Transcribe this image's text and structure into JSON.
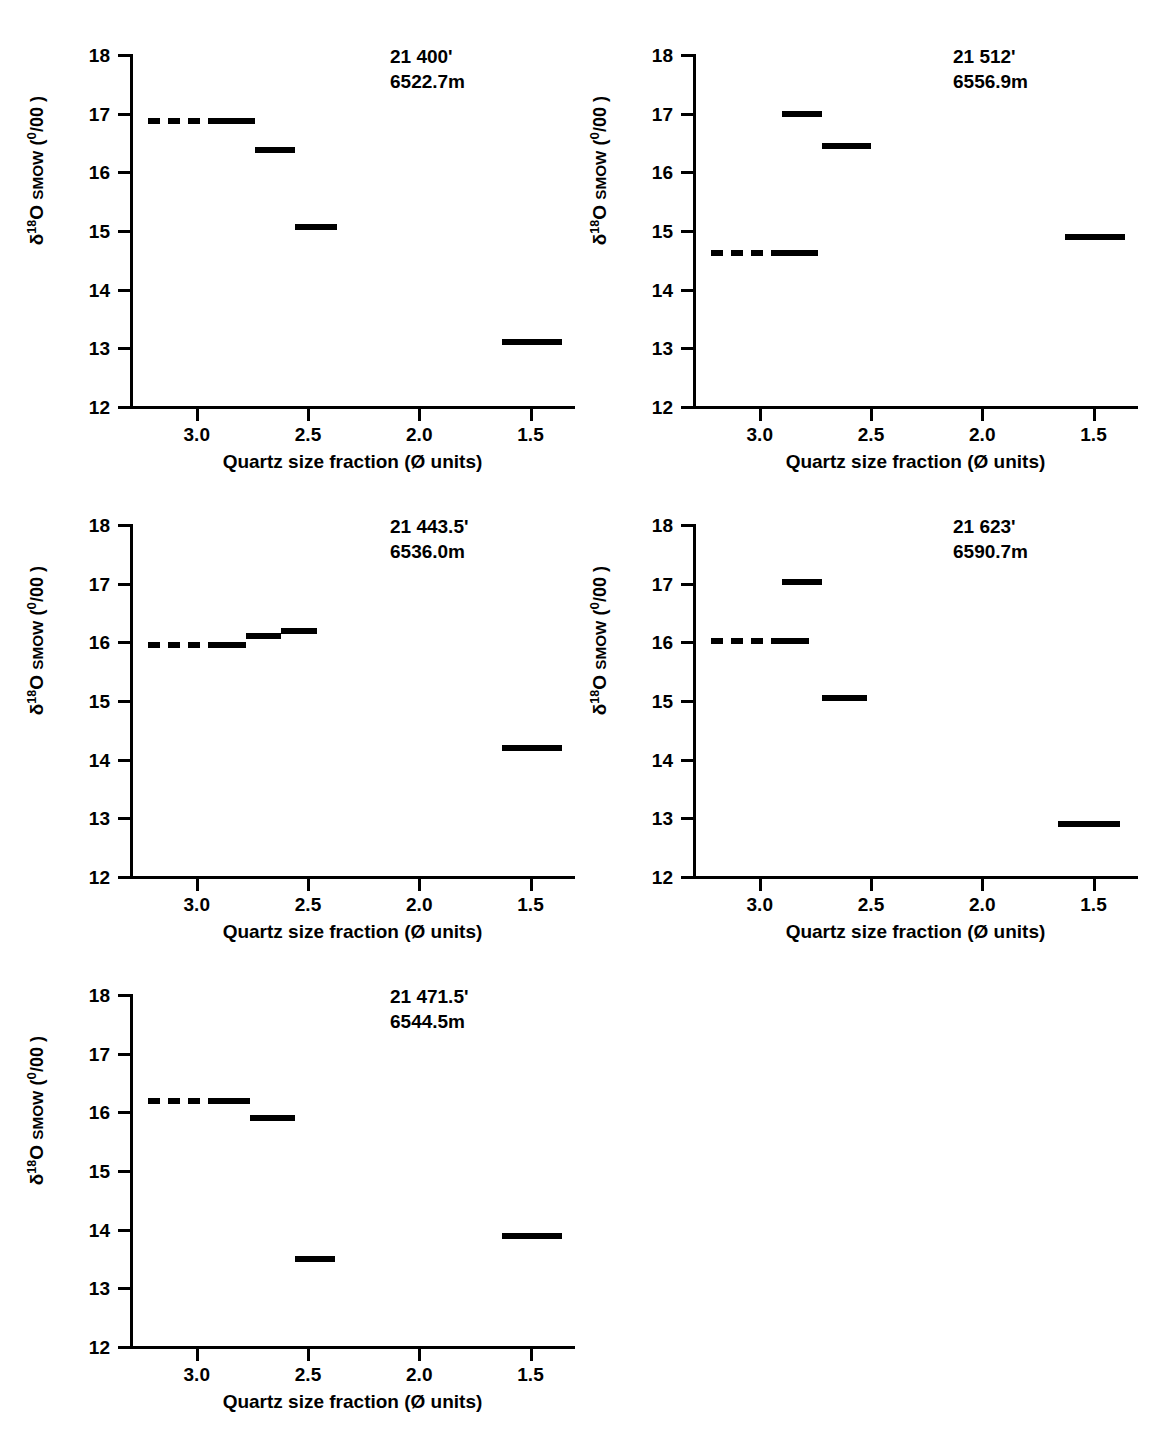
{
  "figure": {
    "axis": {
      "y_label_delta": "δ",
      "y_label_sup": "18",
      "y_label_o": "O",
      "y_label_smow": "SMOW",
      "y_label_units_open": "(",
      "y_label_permil_num": "0",
      "y_label_permil_slash": "/",
      "y_label_permil_den": "00",
      "y_label_units_close": ")",
      "y_ticks": [
        "18",
        "17",
        "16",
        "15",
        "14",
        "13",
        "12"
      ],
      "x_ticks": [
        "3.0",
        "2.5",
        "2.0",
        "1.5"
      ],
      "x_title": "Quartz size fraction (Ø units)"
    },
    "panels": [
      {
        "id": "panel-21400",
        "depth_feet": "21 400'",
        "depth_meters": "6522.7m",
        "bars": [
          {
            "x_start": 3.22,
            "x_end": 2.92,
            "value": 16.88,
            "dashed": true
          },
          {
            "x_start": 2.92,
            "x_end": 2.74,
            "value": 16.88,
            "dashed": false
          },
          {
            "x_start": 2.74,
            "x_end": 2.56,
            "value": 16.38,
            "dashed": false
          },
          {
            "x_start": 2.56,
            "x_end": 2.37,
            "value": 15.07,
            "dashed": false
          },
          {
            "x_start": 1.63,
            "x_end": 1.36,
            "value": 13.1,
            "dashed": false
          }
        ]
      },
      {
        "id": "panel-21512",
        "depth_feet": "21 512'",
        "depth_meters": "6556.9m",
        "bars": [
          {
            "x_start": 3.22,
            "x_end": 2.92,
            "value": 14.63,
            "dashed": true
          },
          {
            "x_start": 2.92,
            "x_end": 2.74,
            "value": 14.63,
            "dashed": false
          },
          {
            "x_start": 2.9,
            "x_end": 2.72,
            "value": 17.0,
            "dashed": false
          },
          {
            "x_start": 2.72,
            "x_end": 2.5,
            "value": 16.45,
            "dashed": false
          },
          {
            "x_start": 1.63,
            "x_end": 1.36,
            "value": 14.9,
            "dashed": false
          }
        ]
      },
      {
        "id": "panel-21443",
        "depth_feet": "21 443.5'",
        "depth_meters": "6536.0m",
        "bars": [
          {
            "x_start": 3.22,
            "x_end": 2.92,
            "value": 15.95,
            "dashed": true
          },
          {
            "x_start": 2.92,
            "x_end": 2.78,
            "value": 15.95,
            "dashed": false
          },
          {
            "x_start": 2.78,
            "x_end": 2.62,
            "value": 16.1,
            "dashed": false
          },
          {
            "x_start": 2.62,
            "x_end": 2.46,
            "value": 16.2,
            "dashed": false
          },
          {
            "x_start": 1.63,
            "x_end": 1.36,
            "value": 14.2,
            "dashed": false
          }
        ]
      },
      {
        "id": "panel-21623",
        "depth_feet": "21 623'",
        "depth_meters": "6590.7m",
        "bars": [
          {
            "x_start": 3.22,
            "x_end": 2.92,
            "value": 16.02,
            "dashed": true
          },
          {
            "x_start": 2.92,
            "x_end": 2.78,
            "value": 16.02,
            "dashed": false
          },
          {
            "x_start": 2.9,
            "x_end": 2.72,
            "value": 17.02,
            "dashed": false
          },
          {
            "x_start": 2.72,
            "x_end": 2.52,
            "value": 15.05,
            "dashed": false
          },
          {
            "x_start": 1.66,
            "x_end": 1.38,
            "value": 12.9,
            "dashed": false
          }
        ]
      },
      {
        "id": "panel-21471",
        "depth_feet": "21 471.5'",
        "depth_meters": "6544.5m",
        "bars": [
          {
            "x_start": 3.22,
            "x_end": 2.92,
            "value": 16.2,
            "dashed": true
          },
          {
            "x_start": 2.92,
            "x_end": 2.76,
            "value": 16.2,
            "dashed": false
          },
          {
            "x_start": 2.76,
            "x_end": 2.56,
            "value": 15.9,
            "dashed": false
          },
          {
            "x_start": 2.56,
            "x_end": 2.38,
            "value": 13.5,
            "dashed": false
          },
          {
            "x_start": 1.63,
            "x_end": 1.36,
            "value": 13.9,
            "dashed": false
          }
        ]
      }
    ]
  },
  "chart_data": {
    "type": "bar",
    "title": "",
    "xlabel": "Quartz size fraction (Ø units)",
    "ylabel": "δ18O SMOW (o/oo)",
    "xlim": [
      3.3,
      1.3
    ],
    "ylim": [
      12,
      18
    ],
    "x_reversed": true,
    "grid": false,
    "legend": "none",
    "y_ticks": [
      18,
      17,
      16,
      15,
      14,
      13,
      12
    ],
    "x_ticks": [
      3.0,
      2.5,
      2.0,
      1.5
    ],
    "panels": [
      {
        "label": "21 400' / 6522.7m",
        "categories": [
          "3.22-2.74 (dashed lead)",
          "2.74-2.56",
          "2.56-2.37",
          "1.63-1.36"
        ],
        "values": [
          16.88,
          16.38,
          15.07,
          13.1
        ]
      },
      {
        "label": "21 512' / 6556.9m",
        "categories": [
          "3.22-2.74 (dashed lead)",
          "2.90-2.72",
          "2.72-2.50",
          "1.63-1.36"
        ],
        "values": [
          14.63,
          17.0,
          16.45,
          14.9
        ]
      },
      {
        "label": "21 443.5' / 6536.0m",
        "categories": [
          "3.22-2.78 (dashed lead)",
          "2.78-2.62",
          "2.62-2.46",
          "1.63-1.36"
        ],
        "values": [
          15.95,
          16.1,
          16.2,
          14.2
        ]
      },
      {
        "label": "21 623' / 6590.7m",
        "categories": [
          "3.22-2.78 (dashed lead)",
          "2.90-2.72",
          "2.72-2.52",
          "1.66-1.38"
        ],
        "values": [
          16.02,
          17.02,
          15.05,
          12.9
        ]
      },
      {
        "label": "21 471.5' / 6544.5m",
        "categories": [
          "3.22-2.76 (dashed lead)",
          "2.76-2.56",
          "2.56-2.38",
          "1.63-1.36"
        ],
        "values": [
          16.2,
          15.9,
          13.5,
          13.9
        ]
      }
    ]
  }
}
